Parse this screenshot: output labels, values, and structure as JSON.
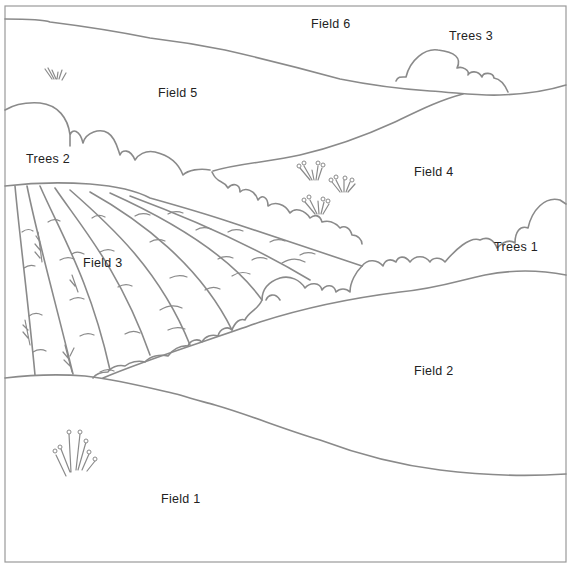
{
  "diagram": {
    "type": "landscape-map",
    "stroke_color": "#8a8a8a",
    "background": "#ffffff",
    "labels": {
      "field1": "Field 1",
      "field2": "Field 2",
      "field3": "Field 3",
      "field4": "Field 4",
      "field5": "Field 5",
      "field6": "Field 6",
      "trees1": "Trees 1",
      "trees2": "Trees 2",
      "trees3": "Trees 3"
    }
  }
}
